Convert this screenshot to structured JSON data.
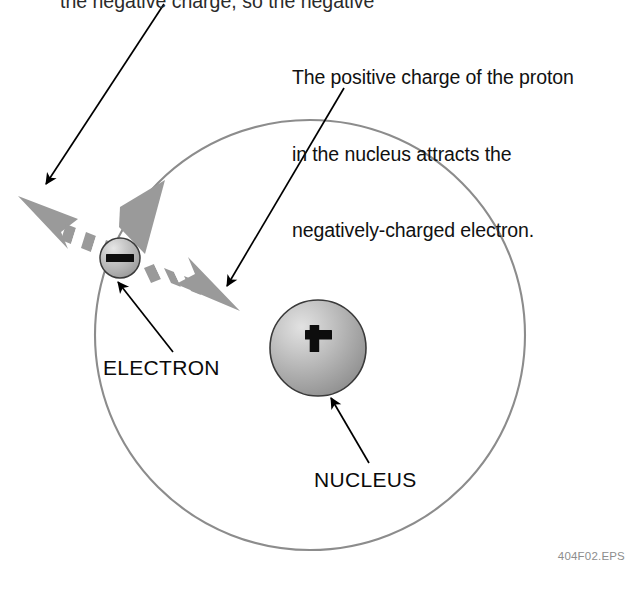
{
  "figure": {
    "type": "diagram",
    "background_color": "#ffffff"
  },
  "annotations": {
    "top_partial_line": "the negative charge, so the negative",
    "caption": {
      "line1": "The positive charge of the proton",
      "line2": "in the nucleus attracts the",
      "line3": "negatively-charged electron."
    }
  },
  "labels": {
    "electron": "ELECTRON",
    "nucleus": "NUCLEUS"
  },
  "particles": {
    "electron": {
      "symbol": "−",
      "charge_sign": "minus",
      "cx": 120,
      "cy": 258,
      "r": 20,
      "fill": "#b3b3b3"
    },
    "nucleus": {
      "symbol": "+",
      "charge_sign": "plus",
      "cx": 318,
      "cy": 348,
      "r": 48,
      "fill": "#a9a9a9"
    }
  },
  "orbit": {
    "cx": 310,
    "cy": 335,
    "r": 215,
    "stroke": "#8c8c8c",
    "direction": "clockwise"
  },
  "arrows": {
    "callout_color": "#000000",
    "force_arrow_color": "#949494",
    "callouts": [
      {
        "name": "callout-to-electron",
        "x1": 164,
        "y1": 8,
        "x2": 45,
        "y2": 186
      },
      {
        "name": "callout-to-nucleus-region",
        "x1": 344,
        "y1": 90,
        "x2": 226,
        "y2": 288
      },
      {
        "name": "leader-electron",
        "x1": 172,
        "y1": 352,
        "x2": 117,
        "y2": 281
      },
      {
        "name": "leader-nucleus",
        "x1": 368,
        "y1": 463,
        "x2": 330,
        "y2": 397
      }
    ]
  },
  "file_id": "404F02.EPS"
}
